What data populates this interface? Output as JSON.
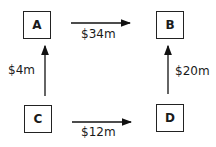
{
  "diagram": {
    "nodes": [
      {
        "id": "A",
        "label": "A"
      },
      {
        "id": "B",
        "label": "B"
      },
      {
        "id": "C",
        "label": "C"
      },
      {
        "id": "D",
        "label": "D"
      }
    ],
    "edges": [
      {
        "from": "A",
        "to": "B",
        "label": "$34m"
      },
      {
        "from": "C",
        "to": "A",
        "label": "$4m"
      },
      {
        "from": "D",
        "to": "B",
        "label": "$20m"
      },
      {
        "from": "C",
        "to": "D",
        "label": "$12m"
      }
    ]
  }
}
